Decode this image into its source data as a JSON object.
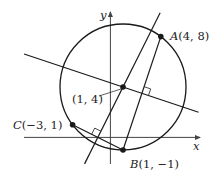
{
  "diagram": {
    "type": "geometry-circle-through-three-points",
    "axes": {
      "x_label": "x",
      "y_label": "y"
    },
    "center": {
      "label": "(1, 4)",
      "x": 1,
      "y": 4
    },
    "radius": 5,
    "points": [
      {
        "id": "A",
        "name": "A",
        "coords": "(4, 8)",
        "x": 4,
        "y": 8
      },
      {
        "id": "B",
        "name": "B",
        "coords": "(1, −1)",
        "x": 1,
        "y": -1
      },
      {
        "id": "C",
        "name": "C",
        "coords": "(−3, 1)",
        "x": -3,
        "y": 1
      }
    ],
    "chords": [
      {
        "from": "A",
        "to": "B"
      },
      {
        "from": "C",
        "to": "B"
      }
    ],
    "perpendicular_bisectors": [
      {
        "of": "AB",
        "slope": -0.3333
      },
      {
        "of": "CB",
        "slope": 2
      }
    ]
  },
  "colors": {
    "stroke": "#1a1a1a",
    "axis": "#444444",
    "text": "#222222"
  }
}
